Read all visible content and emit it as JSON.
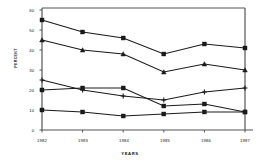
{
  "chart_data": {
    "type": "line",
    "title": "",
    "xlabel": "YEARS",
    "ylabel": "PERCENT",
    "categories": [
      "1982",
      "1983",
      "1984",
      "1985",
      "1986",
      "1987"
    ],
    "x": [
      1982,
      1983,
      1984,
      1985,
      1986,
      1987
    ],
    "ylim": [
      0,
      60
    ],
    "yticks": [
      0,
      10,
      20,
      30,
      40,
      50,
      60
    ],
    "ytick_labels": [
      "0",
      "10",
      "20",
      "30",
      "40",
      "50",
      "60"
    ],
    "grid": false,
    "legend": "none",
    "series": [
      {
        "name": "series-1",
        "marker": "square",
        "values": [
          55,
          49,
          46,
          38,
          43,
          41
        ]
      },
      {
        "name": "series-2",
        "marker": "triangle",
        "values": [
          45,
          40,
          38,
          29,
          33,
          30
        ]
      },
      {
        "name": "series-3",
        "marker": "plus",
        "values": [
          25,
          20,
          17,
          15,
          19,
          21
        ]
      },
      {
        "name": "series-4",
        "marker": "square",
        "values": [
          20,
          21,
          21,
          12,
          13,
          9
        ]
      },
      {
        "name": "series-5",
        "marker": "square",
        "values": [
          10,
          9,
          7,
          8,
          9,
          9
        ]
      }
    ]
  },
  "axis": {
    "y_title": "PERCENT",
    "x_title": "YEARS",
    "y_tick_0": "0",
    "y_tick_1": "10",
    "y_tick_2": "20",
    "y_tick_3": "30",
    "y_tick_4": "40",
    "y_tick_5": "50",
    "y_tick_6": "60",
    "x_tick_0": "1982",
    "x_tick_1": "1983",
    "x_tick_2": "1984",
    "x_tick_3": "1985",
    "x_tick_4": "1986",
    "x_tick_5": "1987"
  },
  "colors": {
    "line": "#1a1a1a",
    "axis": "#555555",
    "text": "#111111",
    "background": "#ffffff"
  }
}
